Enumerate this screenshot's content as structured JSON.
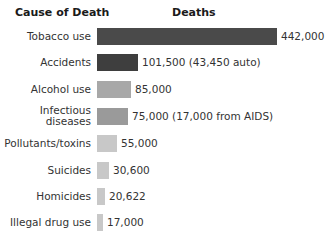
{
  "headers": {
    "cause": "Cause of Death",
    "deaths": "Deaths"
  },
  "chart_data": {
    "type": "bar",
    "orientation": "horizontal",
    "title": "",
    "xlabel": "Deaths",
    "ylabel": "Cause of Death",
    "categories": [
      "Tobacco use",
      "Accidents",
      "Alcohol use",
      "Infectious diseases",
      "Pollutants/toxins",
      "Suicides",
      "Homicides",
      "Illegal drug use"
    ],
    "values": [
      442000,
      101500,
      85000,
      75000,
      55000,
      30600,
      20622,
      17000
    ],
    "value_labels": [
      "442,000",
      "101,500 (43,450 auto)",
      "85,000",
      "75,000 (17,000 from AIDS)",
      "55,000",
      "30,600",
      "20,622",
      "17,000"
    ],
    "grid": false,
    "legend": null
  },
  "rows": [
    {
      "label": "Tobacco use",
      "value": "442,000",
      "color": "#4a4a4a",
      "width": 180,
      "top": 36
    },
    {
      "label": "Accidents",
      "value": "101,500 (43,450 auto)",
      "color": "#3e3e3e",
      "width": 41,
      "top": 62
    },
    {
      "label": "Alcohol use",
      "value": "85,000",
      "color": "#a8a8a8",
      "width": 34,
      "top": 89
    },
    {
      "label": "Infectious\ndiseases",
      "value": "75,000 (17,000 from AIDS)",
      "color": "#9a9a9a",
      "width": 31,
      "top": 116
    },
    {
      "label": "Pollutants/toxins",
      "value": "55,000",
      "color": "#c8c8c8",
      "width": 20,
      "top": 143
    },
    {
      "label": "Suicides",
      "value": "30,600",
      "color": "#c8c8c8",
      "width": 12,
      "top": 170
    },
    {
      "label": "Homicides",
      "value": "20,622",
      "color": "#c8c8c8",
      "width": 8,
      "top": 196
    },
    {
      "label": "Illegal drug use",
      "value": "17,000",
      "color": "#c8c8c8",
      "width": 6,
      "top": 222
    }
  ]
}
